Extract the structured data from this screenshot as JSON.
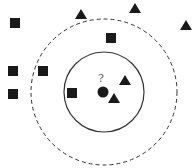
{
  "diagram": {
    "title": "",
    "query": {
      "label": "?",
      "x": 103,
      "y": 92,
      "r": 5.5,
      "label_x": 98,
      "label_y": 73
    },
    "inner_circle": {
      "cx": 104,
      "cy": 92,
      "r": 40,
      "style": "solid"
    },
    "outer_circle": {
      "cx": 104,
      "cy": 92,
      "r": 73,
      "style": "dashed"
    },
    "squares": [
      {
        "x": 15,
        "y": 23
      },
      {
        "x": 111,
        "y": 38
      },
      {
        "x": 13,
        "y": 71
      },
      {
        "x": 43,
        "y": 71
      },
      {
        "x": 13,
        "y": 94
      },
      {
        "x": 72,
        "y": 93
      }
    ],
    "triangles": [
      {
        "x": 81,
        "y": 14
      },
      {
        "x": 135,
        "y": 8
      },
      {
        "x": 186,
        "y": 25
      },
      {
        "x": 125,
        "y": 80
      },
      {
        "x": 114,
        "y": 98
      }
    ],
    "colors": {
      "shape": "#1a1a1a",
      "line": "#333333",
      "background": "#ffffff"
    }
  }
}
